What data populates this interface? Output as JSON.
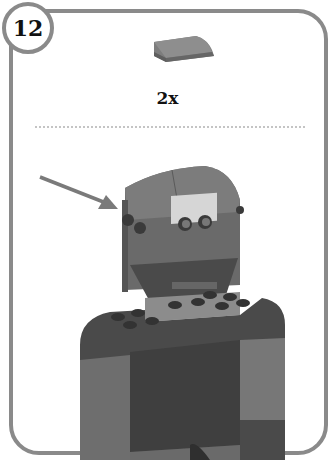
{
  "step": {
    "number": "12"
  },
  "parts_callout": {
    "quantity_label": "2x",
    "part_name": "curved slope brick",
    "part_color": "#7d7d7d"
  },
  "model": {
    "description": "robot figure with head, eyes and torso",
    "arrow_target": "top of head",
    "colors": {
      "body_dark": "#4a4a4a",
      "body_mid": "#6b6b6b",
      "body_light": "#8c8c8c",
      "eye_plate": "#d6d6d6",
      "frame": "#8a8a8a"
    }
  },
  "icons": {
    "arrow": "arrow-pointer-icon"
  }
}
